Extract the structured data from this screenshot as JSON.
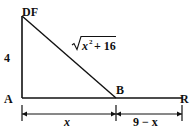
{
  "diagram": {
    "points": {
      "DF": "DF",
      "A": "A",
      "B": "B",
      "R": "R"
    },
    "segments": {
      "vertical_length": "4",
      "hypotenuse_radicand_var": "x",
      "hypotenuse_exponent": "2",
      "hypotenuse_plus": "+ 16",
      "AB_length": "x",
      "BR_length": "9 − x"
    },
    "colors": {
      "stroke": "#111111",
      "background": "#ffffff"
    }
  }
}
